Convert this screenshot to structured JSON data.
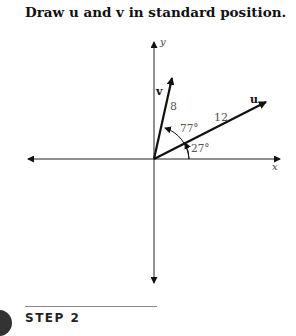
{
  "title": "Draw u and v in standard position.",
  "diagram": {
    "axes": {
      "x_label": "x",
      "y_label": "y"
    },
    "vectors": [
      {
        "name": "u",
        "magnitude_label": "12",
        "angle_label": "27°",
        "angle_deg": 27
      },
      {
        "name": "v",
        "magnitude_label": "8",
        "angle_label": "77°",
        "angle_deg": 77
      }
    ]
  },
  "step": {
    "label": "STEP 2"
  }
}
